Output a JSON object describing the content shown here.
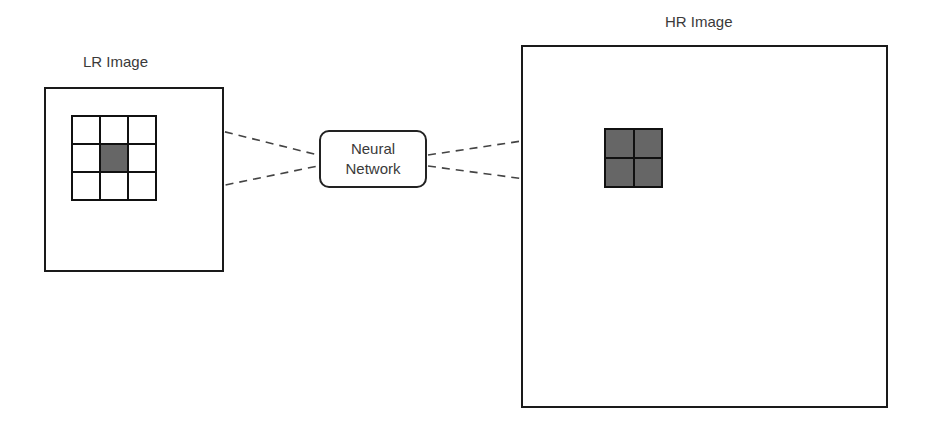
{
  "lr_image": {
    "label": "LR Image",
    "grid": {
      "rows": 3,
      "cols": 3,
      "highlighted_cell": [
        1,
        1
      ]
    }
  },
  "neural_network": {
    "line1": "Neural",
    "line2": "Network"
  },
  "hr_image": {
    "label": "HR Image",
    "grid": {
      "rows": 2,
      "cols": 2,
      "all_highlighted": true
    }
  },
  "colors": {
    "stroke": "#1a1a1a",
    "highlight": "#666666",
    "dash": "#444444"
  }
}
